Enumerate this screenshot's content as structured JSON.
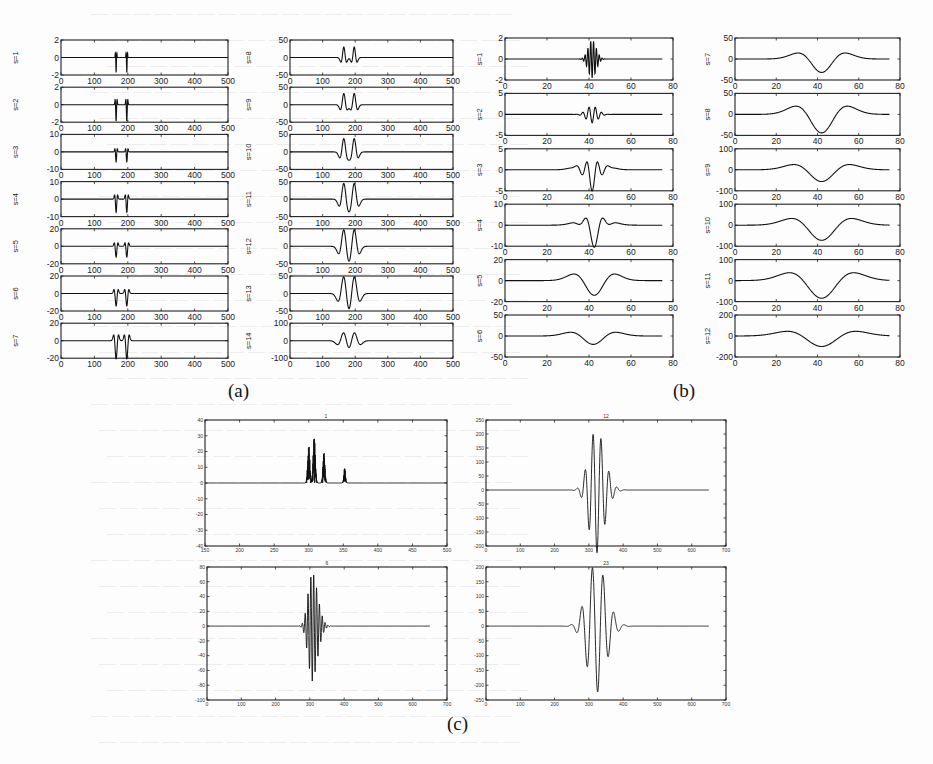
{
  "figure": {
    "captions": {
      "a": "(a)",
      "b": "(b)",
      "c": "(c)"
    }
  },
  "chart_data": [
    {
      "panel": "a",
      "type": "line",
      "description": "Wavelet transform coefficients of a signal at scales s=1..14, two singularities near x=165 and x=197",
      "xlim": [
        0,
        500
      ],
      "xticks": [
        0,
        100,
        200,
        300,
        400,
        500
      ],
      "grid": false,
      "subplots": [
        {
          "ylabel": "s=1",
          "ylim": [
            -2,
            2
          ],
          "yticks": [
            -2,
            0,
            2
          ],
          "features": [
            {
              "x": 165,
              "amp": -1.8,
              "w": 1.2
            },
            {
              "x": 197,
              "amp": -1.8,
              "w": 1.2
            }
          ],
          "style": "spike"
        },
        {
          "ylabel": "s=2",
          "ylim": [
            -2,
            2
          ],
          "yticks": [
            -2,
            0,
            2
          ],
          "features": [
            {
              "x": 165,
              "amp": -2,
              "w": 1.6
            },
            {
              "x": 197,
              "amp": -2,
              "w": 1.6
            }
          ],
          "style": "spike"
        },
        {
          "ylabel": "s=3",
          "ylim": [
            -10,
            10
          ],
          "yticks": [
            -10,
            0,
            10
          ],
          "features": [
            {
              "x": 165,
              "amp": -6,
              "w": 2
            },
            {
              "x": 197,
              "amp": -6,
              "w": 2
            }
          ],
          "style": "spike"
        },
        {
          "ylabel": "s=4",
          "ylim": [
            -10,
            10
          ],
          "yticks": [
            -10,
            0,
            10
          ],
          "features": [
            {
              "x": 165,
              "amp": -8,
              "w": 2.5
            },
            {
              "x": 197,
              "amp": -8,
              "w": 2.5
            }
          ],
          "style": "spike"
        },
        {
          "ylabel": "s=5",
          "ylim": [
            -20,
            20
          ],
          "yticks": [
            -20,
            0,
            20
          ],
          "features": [
            {
              "x": 165,
              "amp": -13,
              "w": 3
            },
            {
              "x": 197,
              "amp": -13,
              "w": 3
            }
          ],
          "style": "spike"
        },
        {
          "ylabel": "s=6",
          "ylim": [
            -20,
            20
          ],
          "yticks": [
            -20,
            0,
            20
          ],
          "features": [
            {
              "x": 165,
              "amp": -15,
              "w": 3.5
            },
            {
              "x": 197,
              "amp": -15,
              "w": 3.5
            }
          ],
          "style": "spike"
        },
        {
          "ylabel": "s=7",
          "ylim": [
            -20,
            20
          ],
          "yticks": [
            -20,
            0,
            20
          ],
          "features": [
            {
              "x": 165,
              "amp": -22,
              "w": 4
            },
            {
              "x": 197,
              "amp": -22,
              "w": 4
            }
          ],
          "style": "spike"
        },
        {
          "ylabel": "s=8",
          "ylim": [
            -50,
            50
          ],
          "yticks": [
            -50,
            0,
            50
          ],
          "features": [
            {
              "x": 165,
              "amp": -30,
              "w": 5
            },
            {
              "x": 197,
              "amp": -30,
              "w": 5
            }
          ],
          "style": "mexhat"
        },
        {
          "ylabel": "s=9",
          "ylim": [
            -50,
            50
          ],
          "yticks": [
            -50,
            0,
            50
          ],
          "features": [
            {
              "x": 165,
              "amp": -32,
              "w": 6
            },
            {
              "x": 197,
              "amp": -32,
              "w": 6
            }
          ],
          "style": "mexhat"
        },
        {
          "ylabel": "s=10",
          "ylim": [
            -50,
            50
          ],
          "yticks": [
            -50,
            0,
            50
          ],
          "features": [
            {
              "x": 165,
              "amp": -38,
              "w": 7
            },
            {
              "x": 197,
              "amp": -38,
              "w": 7
            }
          ],
          "style": "mexhat"
        },
        {
          "ylabel": "s=11",
          "ylim": [
            -50,
            50
          ],
          "yticks": [
            -50,
            0,
            50
          ],
          "features": [
            {
              "x": 165,
              "amp": -45,
              "w": 8
            },
            {
              "x": 197,
              "amp": -45,
              "w": 8
            }
          ],
          "style": "mexhat"
        },
        {
          "ylabel": "s=12",
          "ylim": [
            -50,
            50
          ],
          "yticks": [
            -50,
            0,
            50
          ],
          "features": [
            {
              "x": 165,
              "amp": -48,
              "w": 9
            },
            {
              "x": 197,
              "amp": -48,
              "w": 9
            }
          ],
          "style": "mexhat"
        },
        {
          "ylabel": "s=13",
          "ylim": [
            -50,
            50
          ],
          "yticks": [
            -50,
            0,
            50
          ],
          "features": [
            {
              "x": 165,
              "amp": -50,
              "w": 10
            },
            {
              "x": 197,
              "amp": -50,
              "w": 10
            }
          ],
          "style": "mexhat"
        },
        {
          "ylabel": "s=14",
          "ylim": [
            -100,
            100
          ],
          "yticks": [
            -100,
            0,
            100
          ],
          "features": [
            {
              "x": 165,
              "amp": -50,
              "w": 11
            },
            {
              "x": 197,
              "amp": -50,
              "w": 11
            }
          ],
          "style": "mexhat"
        }
      ]
    },
    {
      "panel": "b",
      "type": "line",
      "description": "Wavelet coefficients at scales s=1..12 of a localized oscillation centred near x=42",
      "xlim": [
        0,
        80
      ],
      "xticks": [
        0,
        20,
        40,
        60,
        80
      ],
      "data_x_end": 75,
      "grid": false,
      "subplots": [
        {
          "ylabel": "s=1",
          "ylim": [
            -2,
            2
          ],
          "yticks": [
            -2,
            0,
            2
          ],
          "center": 41.5,
          "amp": 1.8,
          "width": 2.6,
          "freq": 1.6
        },
        {
          "ylabel": "s=2",
          "ylim": [
            -5,
            5
          ],
          "yticks": [
            -5,
            0,
            5
          ],
          "center": 41.5,
          "amp": 2.0,
          "width": 3.6,
          "freq": 1.0
        },
        {
          "ylabel": "s=3",
          "ylim": [
            -5,
            5
          ],
          "yticks": [
            -5,
            0,
            5
          ],
          "center": 41.5,
          "amp": 3.6,
          "width": 4.6,
          "freq": 0.75
        },
        {
          "ylabel": "s=4",
          "ylim": [
            -10,
            10
          ],
          "yticks": [
            -10,
            0,
            10
          ],
          "center": 42.5,
          "amp": 7.5,
          "width": 5.0,
          "freq": 0.5
        },
        {
          "ylabel": "s=5",
          "ylim": [
            -20,
            20
          ],
          "yticks": [
            -20,
            0,
            20
          ],
          "center": 42.5,
          "amp": 14,
          "width": 5.6,
          "freq": 0.0
        },
        {
          "ylabel": "s=6",
          "ylim": [
            -50,
            50
          ],
          "yticks": [
            -50,
            0,
            50
          ],
          "center": 42,
          "amp": 20,
          "width": 6.2,
          "freq": 0.0
        },
        {
          "ylabel": "s=7",
          "ylim": [
            -50,
            50
          ],
          "yticks": [
            -50,
            0,
            50
          ],
          "center": 42,
          "amp": 32,
          "width": 6.6,
          "freq": 0.0
        },
        {
          "ylabel": "s=8",
          "ylim": [
            -50,
            50
          ],
          "yticks": [
            -50,
            0,
            50
          ],
          "center": 42,
          "amp": 44,
          "width": 7.2,
          "freq": 0.0
        },
        {
          "ylabel": "s=9",
          "ylim": [
            -100,
            100
          ],
          "yticks": [
            -100,
            0,
            100
          ],
          "center": 42,
          "amp": 56,
          "width": 7.8,
          "freq": 0.0
        },
        {
          "ylabel": "s=10",
          "ylim": [
            -100,
            100
          ],
          "yticks": [
            -100,
            0,
            100
          ],
          "center": 42,
          "amp": 72,
          "width": 8.4,
          "freq": 0.0
        },
        {
          "ylabel": "s=11",
          "ylim": [
            -100,
            100
          ],
          "yticks": [
            -100,
            0,
            100
          ],
          "center": 42,
          "amp": 84,
          "width": 9.0,
          "freq": 0.0
        },
        {
          "ylabel": "s=12",
          "ylim": [
            -200,
            200
          ],
          "yticks": [
            -200,
            0,
            200
          ],
          "center": 42,
          "amp": 100,
          "width": 9.6,
          "freq": 0.0
        }
      ]
    },
    {
      "panel": "c",
      "type": "line",
      "description": "Four wavelet-coefficient traces (titles illegible; approx. 1, 12, 6, 23)",
      "subplots": [
        {
          "title": "1",
          "xlim": [
            150,
            500
          ],
          "xticks": [
            150,
            200,
            250,
            300,
            350,
            400,
            450,
            500
          ],
          "ylim": [
            -40,
            40
          ],
          "yticks": [
            40,
            30,
            20,
            10,
            0,
            -10,
            -20,
            -30,
            -40
          ],
          "bursts": [
            {
              "x": 300,
              "amp": 25,
              "neg": -20,
              "w": 2.2
            },
            {
              "x": 308,
              "amp": 30,
              "neg": -30,
              "w": 2.2
            },
            {
              "x": 322,
              "amp": 20,
              "neg": -20,
              "w": 2.0
            },
            {
              "x": 352,
              "amp": 10,
              "neg": -10,
              "w": 1.6
            }
          ]
        },
        {
          "title": "12",
          "xlim": [
            0,
            700
          ],
          "xticks": [
            0,
            100,
            200,
            300,
            400,
            500,
            600,
            700
          ],
          "ylim": [
            -200,
            250
          ],
          "yticks": [
            250,
            200,
            150,
            100,
            50,
            0,
            -50,
            -100,
            -150,
            -200
          ],
          "data_x_end": 650,
          "center": 318,
          "amp": 230,
          "width": 28,
          "freq": 0.043,
          "decay_right": 1.3
        },
        {
          "title": "6",
          "xlim": [
            0,
            700
          ],
          "xticks": [
            0,
            100,
            200,
            300,
            400,
            500,
            600,
            700
          ],
          "ylim": [
            -100,
            80
          ],
          "yticks": [
            80,
            60,
            40,
            20,
            0,
            -20,
            -40,
            -60,
            -80,
            -100
          ],
          "data_x_end": 650,
          "center": 305,
          "amp": 75,
          "width": 16,
          "freq": 0.12,
          "decay_right": 1.5
        },
        {
          "title": "23",
          "xlim": [
            0,
            700
          ],
          "xticks": [
            0,
            100,
            200,
            300,
            400,
            500,
            600,
            700
          ],
          "ylim": [
            -250,
            200
          ],
          "yticks": [
            200,
            150,
            100,
            50,
            0,
            -50,
            -100,
            -150,
            -200,
            -250
          ],
          "data_x_end": 650,
          "center": 318,
          "amp": 230,
          "width": 36,
          "freq": 0.032,
          "decay_right": 1.2
        }
      ]
    }
  ]
}
